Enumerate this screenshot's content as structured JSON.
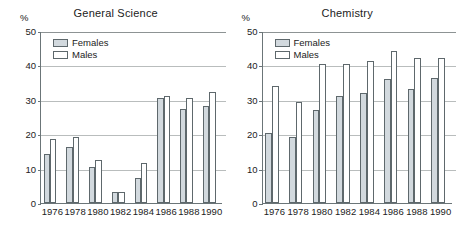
{
  "figure": {
    "background_color": "#ffffff",
    "axis_color": "#6b7578",
    "grid_color": "#b9bdbd",
    "female_color": "#d2d9de",
    "male_color": "#ffffff"
  },
  "panels": [
    {
      "title": "General Science",
      "unit_label": "%",
      "legend": [
        {
          "key": "females",
          "label": "Females"
        },
        {
          "key": "males",
          "label": "Males"
        }
      ],
      "yticks": [
        "0",
        "10",
        "20",
        "30",
        "40",
        "50"
      ]
    },
    {
      "title": "Chemistry",
      "unit_label": "%",
      "legend": [
        {
          "key": "females",
          "label": "Females"
        },
        {
          "key": "males",
          "label": "Males"
        }
      ],
      "yticks": [
        "0",
        "10",
        "20",
        "30",
        "40",
        "50"
      ]
    }
  ],
  "chart_data": [
    {
      "type": "bar",
      "title": "General Science",
      "xlabel": "",
      "ylabel": "%",
      "ylim": [
        0,
        50
      ],
      "ytick_values": [
        0,
        10,
        20,
        30,
        40,
        50
      ],
      "grid": true,
      "legend_position": "top-left",
      "categories": [
        "1976",
        "1978",
        "1980",
        "1982",
        "1984",
        "1986",
        "1988",
        "1990"
      ],
      "series": [
        {
          "name": "Females",
          "values": [
            14.3,
            16.3,
            10.4,
            3.3,
            7.2,
            30.4,
            27.3,
            28.2
          ]
        },
        {
          "name": "Males",
          "values": [
            18.5,
            19.3,
            12.4,
            3.2,
            11.5,
            31.2,
            30.4,
            32.3
          ]
        }
      ]
    },
    {
      "type": "bar",
      "title": "Chemistry",
      "xlabel": "",
      "ylabel": "%",
      "ylim": [
        0,
        50
      ],
      "ytick_values": [
        0,
        10,
        20,
        30,
        40,
        50
      ],
      "grid": true,
      "legend_position": "top-left",
      "categories": [
        "1976",
        "1978",
        "1980",
        "1982",
        "1984",
        "1986",
        "1988",
        "1990"
      ],
      "series": [
        {
          "name": "Females",
          "values": [
            20.3,
            19.3,
            27.0,
            31.2,
            32.0,
            36.0,
            33.0,
            36.2
          ]
        },
        {
          "name": "Males",
          "values": [
            34.0,
            29.3,
            40.4,
            40.4,
            41.3,
            44.2,
            42.3,
            42.3
          ]
        }
      ]
    }
  ]
}
